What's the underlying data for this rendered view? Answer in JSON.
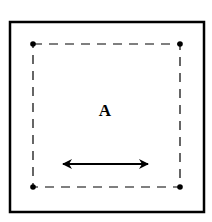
{
  "diagram": {
    "label": "A",
    "outer_box": {
      "x": 10,
      "y": 22,
      "w": 194,
      "h": 190
    },
    "inner_box": {
      "x": 33,
      "y": 44,
      "w": 147,
      "h": 143
    },
    "corner_points": [
      [
        33,
        44
      ],
      [
        180,
        44
      ],
      [
        33,
        187
      ],
      [
        180,
        187
      ]
    ],
    "arrow": {
      "x1": 62,
      "x2": 148,
      "y": 164,
      "type": "double-headed"
    },
    "colors": {
      "stroke": "#000000",
      "background": "#ffffff"
    }
  }
}
